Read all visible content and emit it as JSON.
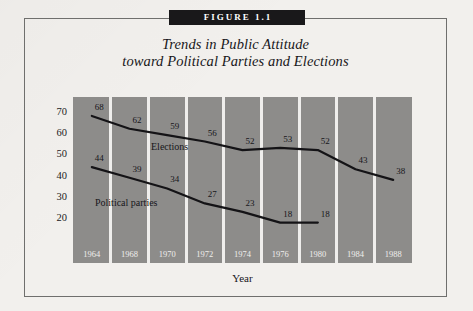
{
  "figure": {
    "banner_label": "FIGURE 1.1",
    "title_line1": "Trends in Public Attitude",
    "title_line2": "toward Political Parties and Elections"
  },
  "chart_data": {
    "type": "line",
    "title": "Trends in Public Attitude toward Political Parties and Elections",
    "xlabel": "Year",
    "ylabel": "",
    "categories": [
      "1964",
      "1968",
      "1970",
      "1972",
      "1974",
      "1976",
      "1980",
      "1984",
      "1988"
    ],
    "x": [
      1964,
      1968,
      1970,
      1972,
      1974,
      1976,
      1980,
      1984,
      1988
    ],
    "ylim": [
      15,
      75
    ],
    "yticks": [
      20,
      30,
      40,
      50,
      60,
      70
    ],
    "grid": false,
    "legend": "inline-labels",
    "series": [
      {
        "name": "Elections",
        "values": [
          68,
          62,
          59,
          56,
          52,
          53,
          52,
          43,
          38
        ],
        "labels": [
          "68",
          "62",
          "59",
          "56",
          "52",
          "53",
          "52",
          "43",
          "38"
        ]
      },
      {
        "name": "Political parties",
        "values": [
          44,
          39,
          34,
          27,
          23,
          18,
          18,
          null,
          null
        ],
        "labels": [
          "44",
          "39",
          "34",
          "27",
          "23",
          "18",
          "18",
          "",
          ""
        ]
      }
    ],
    "colors": {
      "plot_background": "#8d8c8a",
      "line": "#141316",
      "separator": "#efeeec",
      "page_background": "#f2f0ed",
      "banner_background": "#19181a",
      "banner_text": "#ffffff"
    }
  }
}
